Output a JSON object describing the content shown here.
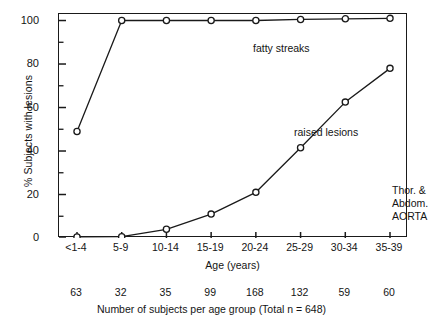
{
  "chart_data": {
    "type": "line",
    "title": "",
    "xlabel": "Age (years)",
    "ylabel": "% Subjects with lesions",
    "categories": [
      "<1-4",
      "5-9",
      "10-14",
      "15-19",
      "20-24",
      "25-29",
      "30-34",
      "35-39"
    ],
    "ylim": [
      0,
      103
    ],
    "yticks": [
      0,
      20,
      40,
      60,
      80,
      100
    ],
    "ytick_labels": [
      "0",
      "20",
      "40",
      "60",
      "80",
      "100"
    ],
    "yminor_ticks": [
      10,
      30,
      50,
      70,
      90
    ],
    "grid": false,
    "legend": "none",
    "series": [
      {
        "name": "fatty streaks",
        "values": [
          49,
          100,
          100,
          100,
          100,
          100.5,
          100.8,
          101
        ],
        "marker": "open-circle"
      },
      {
        "name": "raised lesions",
        "values": [
          0.5,
          0.6,
          4,
          11,
          21,
          41.5,
          62.5,
          78
        ],
        "marker": "open-circle"
      }
    ],
    "annotations": [
      {
        "id": "fatty-streaks-label",
        "text": "fatty streaks"
      },
      {
        "id": "raised-lesions-label",
        "text": "raised lesions"
      },
      {
        "id": "tissue-label",
        "lines": [
          "Thor. &",
          "Abdom.",
          "AORTA"
        ]
      }
    ],
    "secondary_axis": {
      "caption": "Number of subjects per age group (Total n = 648)",
      "values": [
        63,
        32,
        35,
        99,
        168,
        132,
        59,
        60
      ],
      "total": 648
    },
    "colors": {
      "axis": "#1a1a1a",
      "line": "#1a1a1a",
      "marker_face": "#ffffff",
      "text": "#141414",
      "background": "#ffffff"
    }
  }
}
